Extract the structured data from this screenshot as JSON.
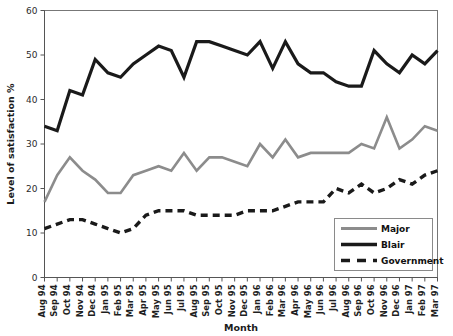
{
  "chart_data": {
    "type": "line",
    "title": "",
    "xlabel": "Month",
    "ylabel": "Level of satisfaction %",
    "ylim": [
      0,
      60
    ],
    "ytick_values": [
      0,
      10,
      20,
      30,
      40,
      50,
      60
    ],
    "ytick_labels": [
      "0",
      "10",
      "20",
      "30",
      "40",
      "50",
      "60"
    ],
    "grid": false,
    "legend_position": "bottom-right",
    "categories": [
      "Aug 94",
      "Sep 94",
      "Oct 94",
      "Nov 94",
      "Dec 94",
      "Jan 95",
      "Feb 95",
      "Mar 95",
      "Apr 95",
      "May 95",
      "Jun 95",
      "Jul 95",
      "Aug 95",
      "Sep 95",
      "Oct 95",
      "Nov 95",
      "Dec 95",
      "Jan 96",
      "Feb 96",
      "Mar 96",
      "Apr 96",
      "May 96",
      "Jun 96",
      "Jul 96",
      "Aug 96",
      "Sep 96",
      "Oct 96",
      "Nov 96",
      "Dec 96",
      "Jan 97",
      "Feb 97",
      "Mar 97"
    ],
    "series": [
      {
        "name": "Major",
        "color": "#8c8c8c",
        "style": "solid",
        "values": [
          17,
          23,
          27,
          24,
          22,
          19,
          19,
          23,
          24,
          25,
          24,
          28,
          24,
          27,
          27,
          26,
          25,
          30,
          27,
          31,
          27,
          28,
          28,
          28,
          28,
          30,
          29,
          36,
          29,
          31,
          34,
          33
        ]
      },
      {
        "name": "Blair",
        "color": "#1a1a1a",
        "style": "solid",
        "values": [
          34,
          33,
          42,
          41,
          49,
          46,
          45,
          48,
          50,
          52,
          51,
          45,
          53,
          53,
          52,
          51,
          50,
          53,
          47,
          53,
          48,
          46,
          46,
          44,
          43,
          43,
          51,
          48,
          46,
          50,
          48,
          51
        ]
      },
      {
        "name": "Government",
        "color": "#1a1a1a",
        "style": "dashed",
        "values": [
          11,
          12,
          13,
          13,
          12,
          11,
          10,
          11,
          14,
          15,
          15,
          15,
          14,
          14,
          14,
          14,
          15,
          15,
          15,
          16,
          17,
          17,
          17,
          20,
          19,
          21,
          19,
          20,
          22,
          21,
          23,
          24
        ]
      }
    ]
  },
  "legend": {
    "entries": [
      {
        "label": "Major"
      },
      {
        "label": "Blair"
      },
      {
        "label": "Government"
      }
    ]
  }
}
